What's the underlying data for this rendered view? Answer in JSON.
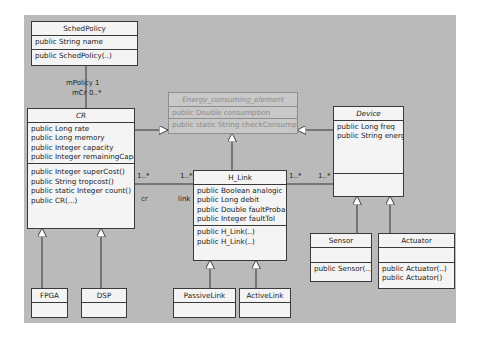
{
  "diagram": {
    "type": "UML class diagram",
    "classes": {
      "schedpolicy": {
        "name": "SchedPolicy",
        "attributes": [
          "public String name"
        ],
        "operations": [
          "public SchedPolicy(..)"
        ]
      },
      "cr": {
        "name": "CR",
        "italic": true,
        "attributes": [
          "public Long rate",
          "public Long memory",
          "public Integer capacity",
          "public Integer remainingCapacity"
        ],
        "operations": [
          "public Integer superCost()",
          "public String tropcost()",
          "public static Integer count()",
          "public CR(...)"
        ]
      },
      "energy": {
        "name": "Energy_consuming_element",
        "italic": true,
        "faded": true,
        "attributes": [
          "public Double consumption"
        ],
        "operations": [
          "public static String checkConsumption()"
        ]
      },
      "device": {
        "name": "Device",
        "italic": true,
        "attributes": [
          "public Long freq",
          "public String energy"
        ],
        "operations": []
      },
      "hlink": {
        "name": "H_Link",
        "attributes": [
          "public Boolean analogic",
          "public Long debit",
          "public Double faultProba",
          "public Integer faultTol"
        ],
        "operations": [
          "public H_Link(..)",
          "public H_Link(..)"
        ]
      },
      "sensor": {
        "name": "Sensor",
        "attributes": [],
        "operations": [
          "public Sensor(..)"
        ]
      },
      "actuator": {
        "name": "Actuator",
        "attributes": [],
        "operations": [
          "public Actuator(..)",
          "public Actuator()"
        ]
      },
      "fpga": {
        "name": "FPGA"
      },
      "dsp": {
        "name": "DSP"
      },
      "passivelink": {
        "name": "PassiveLink"
      },
      "activelink": {
        "name": "ActiveLink"
      }
    },
    "association_labels": {
      "mpolicy": "mPolicy",
      "mpolicy_mult": "1",
      "mcr": "mCr",
      "mcr_mult": "0..*",
      "cr_link_mult_left": "1..*",
      "cr_link_mult_right": "1..*",
      "cr_role": "cr",
      "link_role": "link",
      "link_device_mult_left": "1..*",
      "link_device_mult_right": "1..*"
    }
  }
}
